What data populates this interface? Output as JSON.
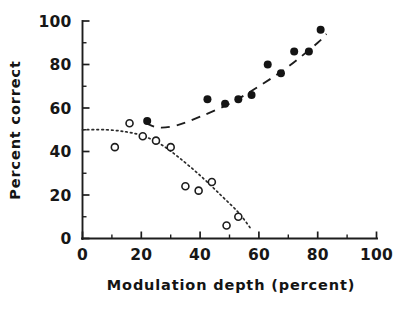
{
  "chart_data": {
    "type": "scatter",
    "title": "",
    "subtitle": "",
    "xlabel": "Modulation depth  (percent)",
    "ylabel": "Percent  correct",
    "xlim": [
      0,
      100
    ],
    "ylim": [
      0,
      100
    ],
    "x_ticks": [
      0,
      20,
      40,
      60,
      80,
      100
    ],
    "x_tick_labels": [
      "0",
      "20",
      "40",
      "60",
      "80",
      "100"
    ],
    "x_minor_ticks": [
      10,
      30,
      50,
      70,
      90
    ],
    "y_ticks": [
      0,
      20,
      40,
      60,
      80,
      100
    ],
    "y_tick_labels": [
      "0",
      "20",
      "40",
      "60",
      "80",
      "100"
    ],
    "y_minor_ticks": [
      10,
      30,
      50,
      70,
      90
    ],
    "grid": false,
    "legend": false,
    "legend_position": "none",
    "series": [
      {
        "name": "filled-circles",
        "marker": "filled-circle",
        "marker_color": "#141414",
        "marker_size": 8,
        "fit_line_style": "dashed",
        "points": [
          {
            "x": 22.0,
            "y": 54
          },
          {
            "x": 42.5,
            "y": 64
          },
          {
            "x": 48.5,
            "y": 62
          },
          {
            "x": 53.0,
            "y": 64
          },
          {
            "x": 57.5,
            "y": 66
          },
          {
            "x": 63.0,
            "y": 80
          },
          {
            "x": 67.5,
            "y": 76
          },
          {
            "x": 72.0,
            "y": 86
          },
          {
            "x": 77.0,
            "y": 86
          },
          {
            "x": 81.0,
            "y": 96
          }
        ],
        "fit_points": [
          {
            "x": 21.5,
            "y": 53
          },
          {
            "x": 26.0,
            "y": 51
          },
          {
            "x": 32.0,
            "y": 52
          },
          {
            "x": 40.0,
            "y": 56
          },
          {
            "x": 50.0,
            "y": 62
          },
          {
            "x": 60.0,
            "y": 70
          },
          {
            "x": 70.0,
            "y": 79
          },
          {
            "x": 80.0,
            "y": 90
          },
          {
            "x": 83.0,
            "y": 94
          }
        ]
      },
      {
        "name": "open-circles",
        "marker": "open-circle",
        "marker_color": "#ffffff",
        "marker_edge_color": "#1d1d1d",
        "marker_size": 7,
        "fit_line_style": "dotted",
        "points": [
          {
            "x": 11.0,
            "y": 42
          },
          {
            "x": 16.0,
            "y": 53
          },
          {
            "x": 20.5,
            "y": 47
          },
          {
            "x": 25.0,
            "y": 45
          },
          {
            "x": 30.0,
            "y": 42
          },
          {
            "x": 35.0,
            "y": 24
          },
          {
            "x": 39.5,
            "y": 22
          },
          {
            "x": 44.0,
            "y": 26
          },
          {
            "x": 49.0,
            "y": 6
          },
          {
            "x": 53.0,
            "y": 10
          }
        ],
        "fit_points": [
          {
            "x": 0.0,
            "y": 50
          },
          {
            "x": 8.0,
            "y": 50
          },
          {
            "x": 15.0,
            "y": 49
          },
          {
            "x": 21.0,
            "y": 47
          },
          {
            "x": 27.0,
            "y": 43
          },
          {
            "x": 33.0,
            "y": 37
          },
          {
            "x": 40.0,
            "y": 29
          },
          {
            "x": 47.0,
            "y": 20
          },
          {
            "x": 53.0,
            "y": 12
          },
          {
            "x": 57.0,
            "y": 5
          }
        ]
      }
    ]
  },
  "axes": {
    "x_title": "Modulation depth  (percent)",
    "y_title": "Percent  correct"
  }
}
